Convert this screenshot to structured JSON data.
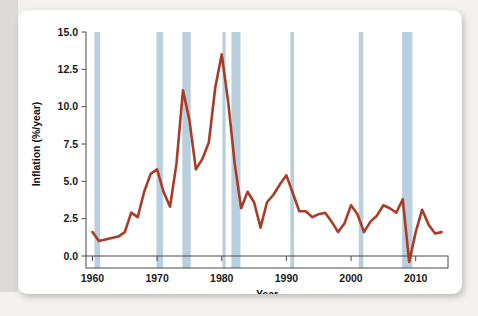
{
  "figure": {
    "background_color": "#ffffff",
    "page_background_color": "#f2f1ef",
    "gutter_color": "#dcdad6"
  },
  "chart_data": {
    "type": "line",
    "title": "",
    "xlabel": "Year",
    "ylabel": "Inflation (%/year)",
    "xlim": [
      1959,
      2015
    ],
    "ylim": [
      -1.0,
      15.0
    ],
    "xticks": [
      1960,
      1970,
      1980,
      1990,
      2000,
      2010
    ],
    "yticks": [
      0.0,
      2.5,
      5.0,
      7.5,
      10.0,
      12.5,
      15.0
    ],
    "ytick_labels": [
      "0.0",
      "2.5",
      "5.0",
      "7.5",
      "10.0",
      "12.5",
      "15.0"
    ],
    "xtick_labels": [
      "1960",
      "1970",
      "1980",
      "1990",
      "2000",
      "2010"
    ],
    "grid": false,
    "legend": null,
    "line_color": "#a93c28",
    "line_width": 2.6,
    "band_color": "#b9cfdd",
    "band_label": "recession",
    "series": [
      {
        "name": "Inflation (%/year)",
        "x": [
          1960,
          1961,
          1962,
          1963,
          1964,
          1965,
          1966,
          1967,
          1968,
          1969,
          1970,
          1971,
          1972,
          1973,
          1974,
          1975,
          1976,
          1977,
          1978,
          1979,
          1980,
          1981,
          1982,
          1983,
          1984,
          1985,
          1986,
          1987,
          1988,
          1989,
          1990,
          1991,
          1992,
          1993,
          1994,
          1995,
          1996,
          1997,
          1998,
          1999,
          2000,
          2001,
          2002,
          2003,
          2004,
          2005,
          2006,
          2007,
          2008,
          2009,
          2010,
          2011,
          2012,
          2013,
          2014
        ],
        "values": [
          1.6,
          1.0,
          1.1,
          1.2,
          1.3,
          1.6,
          2.9,
          2.6,
          4.3,
          5.5,
          5.8,
          4.3,
          3.3,
          6.2,
          11.1,
          9.1,
          5.8,
          6.5,
          7.6,
          11.3,
          13.5,
          10.3,
          6.2,
          3.2,
          4.3,
          3.6,
          1.9,
          3.6,
          4.1,
          4.8,
          5.4,
          4.2,
          3.0,
          3.0,
          2.6,
          2.8,
          2.9,
          2.3,
          1.6,
          2.2,
          3.4,
          2.8,
          1.6,
          2.3,
          2.7,
          3.4,
          3.2,
          2.9,
          3.8,
          -0.4,
          1.6,
          3.1,
          2.1,
          1.5,
          1.6
        ]
      }
    ],
    "recession_bands": [
      {
        "start": 1960.3,
        "end": 1961.2
      },
      {
        "start": 1969.9,
        "end": 1970.9
      },
      {
        "start": 1973.9,
        "end": 1975.2
      },
      {
        "start": 1980.1,
        "end": 1980.6
      },
      {
        "start": 1981.5,
        "end": 1982.9
      },
      {
        "start": 1990.6,
        "end": 1991.2
      },
      {
        "start": 2001.2,
        "end": 2001.9
      },
      {
        "start": 2007.9,
        "end": 2009.5
      }
    ]
  }
}
